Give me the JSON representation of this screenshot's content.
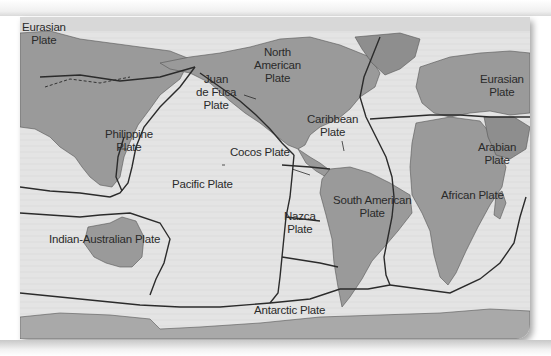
{
  "map": {
    "subject": "Earth's tectonic plates",
    "colors": {
      "ocean": "#e4e4e4",
      "land": "#9a9a9a",
      "land_dark": "#8a8a8a",
      "ice": "#a9a9a9",
      "boundary": "#2b2b2b",
      "label": "#2a2a2a"
    },
    "labels": [
      {
        "id": "eurasian-west",
        "lines": [
          "Eurasian",
          "Plate"
        ],
        "x": 22,
        "y": 21
      },
      {
        "id": "philippine",
        "lines": [
          "Philippine",
          "Plate"
        ],
        "x": 105,
        "y": 128
      },
      {
        "id": "juan-de-fuca",
        "lines": [
          "Juan",
          "de Fuca",
          "Plate"
        ],
        "x": 196,
        "y": 73
      },
      {
        "id": "north-american",
        "lines": [
          "North",
          "American",
          "Plate"
        ],
        "x": 256,
        "y": 46
      },
      {
        "id": "caribbean",
        "lines": [
          "Caribbean",
          "Plate"
        ],
        "x": 307,
        "y": 113
      },
      {
        "id": "cocos",
        "lines": [
          "Cocos Plate"
        ],
        "x": 222,
        "y": 146
      },
      {
        "id": "pacific",
        "lines": [
          "Pacific Plate"
        ],
        "x": 171,
        "y": 178
      },
      {
        "id": "eurasian-east",
        "lines": [
          "Eurasian",
          "Plate"
        ],
        "x": 481,
        "y": 57
      },
      {
        "id": "arabian",
        "lines": [
          "Arabian",
          "Plate"
        ],
        "x": 478,
        "y": 124
      },
      {
        "id": "african",
        "lines": [
          "African Plate"
        ],
        "x": 441,
        "y": 189
      },
      {
        "id": "south-american",
        "lines": [
          "South American",
          "Plate"
        ],
        "x": 333,
        "y": 192
      },
      {
        "id": "nazca",
        "lines": [
          "Nazca",
          "Plate"
        ],
        "x": 284,
        "y": 210
      },
      {
        "id": "indian-australian",
        "lines": [
          "Indian-Australian Plate"
        ],
        "x": 49,
        "y": 229
      },
      {
        "id": "antarctic",
        "lines": [
          "Antarctic Plate"
        ],
        "x": 254,
        "y": 300
      }
    ]
  }
}
